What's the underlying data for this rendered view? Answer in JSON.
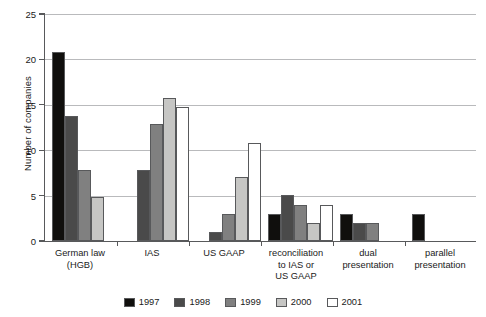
{
  "chart_data": {
    "type": "bar",
    "title": "",
    "xlabel": "",
    "ylabel": "Number of companies",
    "ylim": [
      0,
      25
    ],
    "yticks": [
      0,
      5,
      10,
      15,
      20,
      25
    ],
    "grid": true,
    "legend_position": "bottom",
    "categories": [
      "German law\n(HGB)",
      "IAS",
      "US GAAP",
      "reconciliation\nto IAS or\nUS GAAP",
      "dual\npresentation",
      "parallel\npresentation"
    ],
    "series": [
      {
        "name": "1997",
        "color": "#100f0d",
        "values": [
          20.7,
          0,
          0,
          3,
          3,
          3
        ]
      },
      {
        "name": "1998",
        "color": "#4a4a4a",
        "values": [
          13.7,
          7.8,
          1,
          5,
          2,
          0
        ]
      },
      {
        "name": "1999",
        "color": "#808080",
        "values": [
          7.8,
          12.8,
          3,
          4,
          2,
          0
        ]
      },
      {
        "name": "2000",
        "color": "#c6c6c4",
        "values": [
          4.8,
          15.7,
          7,
          2,
          0,
          0
        ]
      },
      {
        "name": "2001",
        "color": "#ffffff",
        "values": [
          0,
          14.7,
          10.8,
          4,
          0,
          0
        ]
      }
    ]
  },
  "axis": {
    "y_tick_labels": [
      "0",
      "5",
      "10",
      "15",
      "20",
      "25"
    ],
    "y_title": "Number of companies"
  },
  "legend": {
    "items": [
      {
        "label": "1997"
      },
      {
        "label": "1998"
      },
      {
        "label": "1999"
      },
      {
        "label": "2000"
      },
      {
        "label": "2001"
      }
    ]
  },
  "colors": {
    "axis": "#58595b",
    "grid": "#b9babc",
    "bar_outline": "#58595b",
    "text": "#1a1a1a"
  }
}
